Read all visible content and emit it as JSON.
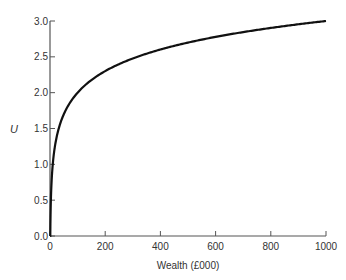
{
  "chart_data": {
    "type": "line",
    "title": "",
    "xlabel": "Wealth (£000)",
    "ylabel": "U",
    "xlim": [
      0,
      1000
    ],
    "ylim": [
      0,
      3.0
    ],
    "x_ticks": [
      "0",
      "200",
      "400",
      "600",
      "800",
      "1000"
    ],
    "y_ticks": [
      "0.0",
      "0.5",
      "1.0",
      "1.5",
      "2.0",
      "2.5",
      "3.0"
    ],
    "grid": false,
    "legend": null,
    "series": [
      {
        "name": "U = log10(Wealth)",
        "x": [
          1,
          2,
          5,
          10,
          20,
          50,
          100,
          200,
          300,
          400,
          500,
          600,
          700,
          800,
          900,
          1000
        ],
        "values": [
          0.0,
          0.3,
          0.7,
          1.0,
          1.3,
          1.7,
          2.0,
          2.3,
          2.48,
          2.6,
          2.7,
          2.78,
          2.85,
          2.9,
          2.95,
          3.0
        ]
      }
    ]
  },
  "colors": {
    "curve": "#111111",
    "axis": "#555555",
    "text": "#333333"
  }
}
